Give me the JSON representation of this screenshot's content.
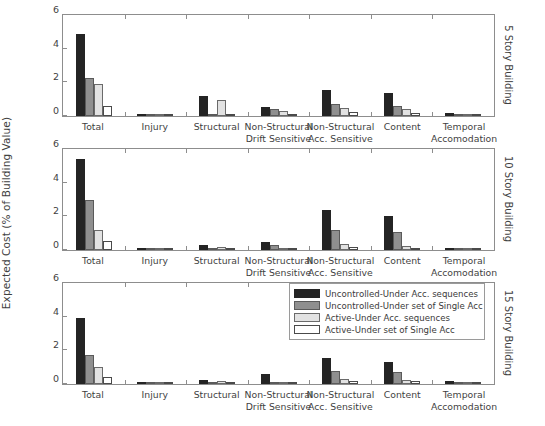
{
  "chart_data": {
    "type": "bar",
    "title": "",
    "xlabel": "",
    "ylabel": "Expected Cost (% of Building Value)",
    "ylim": [
      0,
      6
    ],
    "yticks": [
      0,
      2,
      4,
      6
    ],
    "grid": false,
    "legend_position": "bottom-panel-upper-right",
    "categories": [
      "Total",
      "Injury",
      "Structural",
      "Non-Structural\nDrift Sensitive",
      "Non-Structural\nAcc. Sensitive",
      "Content",
      "Temporal\nAccomodation"
    ],
    "legend": [
      "Uncontrolled-Under Acc. sequences",
      "Uncontrolled-Under set of Single Acc",
      "Active-Under Acc. sequences",
      "Active-Under set of Single Acc"
    ],
    "panels": [
      {
        "row_title": "5 Story Building",
        "series": [
          {
            "name": "Uncontrolled-Under Acc. sequences",
            "values": [
              4.88,
              0.02,
              1.2,
              0.55,
              1.55,
              1.35,
              0.2
            ]
          },
          {
            "name": "Uncontrolled-Under set of Single Acc",
            "values": [
              2.25,
              0.01,
              0.1,
              0.42,
              0.72,
              0.58,
              0.12
            ]
          },
          {
            "name": "Active-Under Acc. sequences",
            "values": [
              1.88,
              0.01,
              0.97,
              0.28,
              0.5,
              0.4,
              0.06
            ]
          },
          {
            "name": "Active-Under set of Single Acc",
            "values": [
              0.58,
              0.0,
              0.02,
              0.05,
              0.22,
              0.15,
              0.03
            ]
          }
        ]
      },
      {
        "row_title": "10 Story Building",
        "series": [
          {
            "name": "Uncontrolled-Under Acc. sequences",
            "values": [
              5.42,
              0.02,
              0.28,
              0.47,
              2.36,
              2.05,
              0.1
            ]
          },
          {
            "name": "Uncontrolled-Under set of Single Acc",
            "values": [
              2.96,
              0.01,
              0.05,
              0.28,
              1.18,
              1.06,
              0.08
            ]
          },
          {
            "name": "Active-Under Acc. sequences",
            "values": [
              1.2,
              0.0,
              0.18,
              0.08,
              0.38,
              0.26,
              0.03
            ]
          },
          {
            "name": "Active-Under set of Single Acc",
            "values": [
              0.52,
              0.0,
              0.02,
              0.04,
              0.17,
              0.14,
              0.02
            ]
          }
        ]
      },
      {
        "row_title": "15 Story Building",
        "series": [
          {
            "name": "Uncontrolled-Under Acc. sequences",
            "values": [
              3.9,
              0.02,
              0.26,
              0.62,
              1.56,
              1.32,
              0.15
            ]
          },
          {
            "name": "Uncontrolled-Under set of Single Acc",
            "values": [
              1.72,
              0.01,
              0.04,
              0.06,
              0.8,
              0.72,
              0.06
            ]
          },
          {
            "name": "Active-Under Acc. sequences",
            "values": [
              1.02,
              0.0,
              0.16,
              0.07,
              0.3,
              0.24,
              0.04
            ]
          },
          {
            "name": "Active-Under set of Single Acc",
            "values": [
              0.42,
              0.0,
              0.02,
              0.05,
              0.2,
              0.15,
              0.03
            ]
          }
        ]
      }
    ],
    "colors": {
      "series_0": "#242424",
      "series_1": "#8f8f8f",
      "series_2": "#e2e2e2",
      "series_3": "#ffffff",
      "axis": "#8d8d8d",
      "text": "#3f3f3f"
    }
  }
}
